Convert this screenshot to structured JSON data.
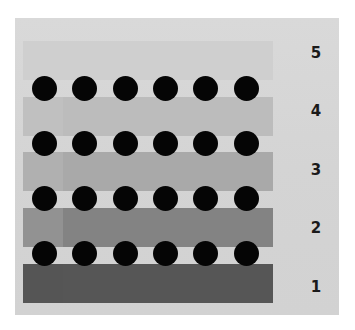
{
  "figure": {
    "labels": [
      "5",
      "4",
      "3",
      "2",
      "1"
    ],
    "bands": [
      {
        "level": "5",
        "color": "#cfcfcf",
        "left_color": "#cfcfcf"
      },
      {
        "level": "4",
        "color": "#bcbcbc",
        "left_color": "#c0c0c0"
      },
      {
        "level": "3",
        "color": "#a9a9a9",
        "left_color": "#b0b0b0"
      },
      {
        "level": "2",
        "color": "#838383",
        "left_color": "#929292"
      },
      {
        "level": "1",
        "color": "#565656",
        "left_color": "#555555"
      }
    ],
    "dot_rows": 4,
    "dots_per_row": 6,
    "dot_color": "#050505",
    "panel_color": "#d6d6d6"
  }
}
